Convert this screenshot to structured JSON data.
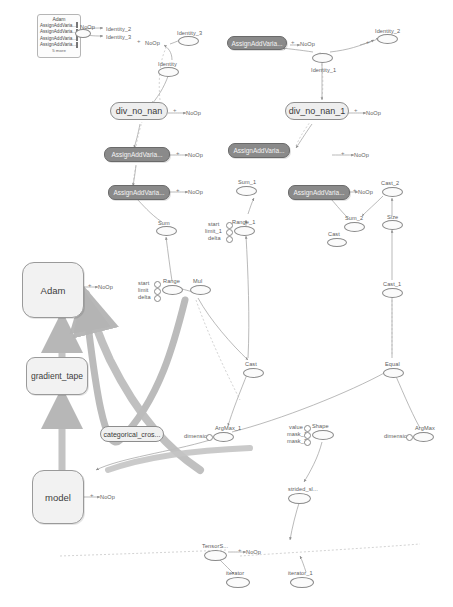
{
  "graph": {
    "title": "TensorBoard computation graph",
    "colors": {
      "node_fill_light": "#f2f2f2",
      "node_fill_dark": "#8a8a8a",
      "node_stroke": "#8d8d8d",
      "edge": "#9a9a9a",
      "tensor_edge": "#b0b0b0",
      "text": "#4a4a4a"
    }
  },
  "group_adam": {
    "title": "Adam",
    "rows": [
      "AssignAddVaria...",
      "AssignAddVaria...",
      "AssignAddVaria...",
      "AssignAddVaria..."
    ],
    "more": "5 more"
  },
  "namespaces": [
    {
      "id": "adam",
      "label": "Adam"
    },
    {
      "id": "gradient",
      "label": "gradient_tape"
    },
    {
      "id": "loss",
      "label": "categorical_cros..."
    },
    {
      "id": "model",
      "label": "model"
    }
  ],
  "pill_nodes": [
    {
      "id": "divnonan",
      "label": "div_no_nan"
    },
    {
      "id": "divnonan1",
      "label": "div_no_nan_1"
    }
  ],
  "dark_nodes": [
    {
      "id": "aav_top",
      "label": "AssignAddVaria..."
    },
    {
      "id": "aav_l1",
      "label": "AssignAddVaria..."
    },
    {
      "id": "aav_l2",
      "label": "AssignAddVaria..."
    },
    {
      "id": "aav_r1",
      "label": "AssignAddVaria..."
    },
    {
      "id": "aav_r2",
      "label": "AssignAddVaria..."
    }
  ],
  "op_nodes": [
    {
      "id": "identity",
      "label": "Identity"
    },
    {
      "id": "identity_1",
      "label": "Identity_1"
    },
    {
      "id": "identity_2a",
      "label": "Identity_2"
    },
    {
      "id": "identity_3a",
      "label": "Identity_3"
    },
    {
      "id": "identity_2b",
      "label": "Identity_2"
    },
    {
      "id": "identity_3b",
      "label": "Identity_3"
    },
    {
      "id": "sum",
      "label": "Sum"
    },
    {
      "id": "sum_1",
      "label": "Sum_1"
    },
    {
      "id": "sum_2",
      "label": "Sum_2"
    },
    {
      "id": "range",
      "label": "Range"
    },
    {
      "id": "range_1",
      "label": "Range_1"
    },
    {
      "id": "mul",
      "label": "Mul"
    },
    {
      "id": "cast",
      "label": "Cast"
    },
    {
      "id": "cast_1",
      "label": "Cast_1"
    },
    {
      "id": "cast_2",
      "label": "Cast_2"
    },
    {
      "id": "cast_3",
      "label": "Cast"
    },
    {
      "id": "size",
      "label": "Size"
    },
    {
      "id": "equal",
      "label": "Equal"
    },
    {
      "id": "argmax",
      "label": "ArgMax"
    },
    {
      "id": "argmax_1",
      "label": "ArgMax_1"
    },
    {
      "id": "shape",
      "label": "Shape"
    },
    {
      "id": "strided",
      "label": "strided_sl..."
    },
    {
      "id": "tensors",
      "label": "TensorS..."
    },
    {
      "id": "iterator",
      "label": "iterator"
    },
    {
      "id": "iterator_1",
      "label": "iterator_1"
    }
  ],
  "noop_labels": [
    {
      "id": "noop_1",
      "label": "NoOp"
    },
    {
      "id": "noop_2",
      "label": "NoOp"
    },
    {
      "id": "noop_3",
      "label": "NoOp"
    },
    {
      "id": "noop_4",
      "label": "NoOp"
    },
    {
      "id": "noop_5",
      "label": "NoOp"
    },
    {
      "id": "noop_6",
      "label": "NoOp"
    },
    {
      "id": "noop_7",
      "label": "NoOp"
    },
    {
      "id": "noop_8",
      "label": "NoOp"
    },
    {
      "id": "noop_9",
      "label": "NoOp"
    },
    {
      "id": "noop_10",
      "label": "NoOp"
    },
    {
      "id": "noop_11",
      "label": "NoOp"
    },
    {
      "id": "noop_12",
      "label": "NoOp"
    }
  ],
  "input_stubs": [
    {
      "id": "range_start",
      "label": "start"
    },
    {
      "id": "range_limit",
      "label": "limit"
    },
    {
      "id": "range_delta",
      "label": "delta"
    },
    {
      "id": "range1_start",
      "label": "start"
    },
    {
      "id": "range1_limit",
      "label": "limit_1"
    },
    {
      "id": "range1_delta",
      "label": "delta"
    },
    {
      "id": "argmax_dim",
      "label": "dimension"
    },
    {
      "id": "argmax1_dim",
      "label": "dimension"
    },
    {
      "id": "strided_value",
      "label": "value"
    },
    {
      "id": "strided_mask1",
      "label": "mask_1"
    },
    {
      "id": "strided_mask2",
      "label": "mask_2"
    }
  ]
}
